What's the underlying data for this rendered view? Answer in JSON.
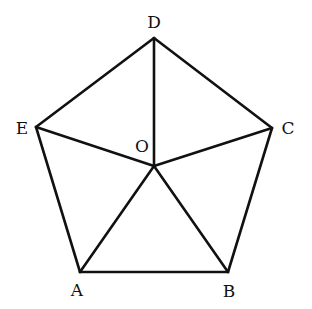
{
  "diagram": {
    "type": "regular-pentagon-with-center",
    "points": {
      "A": {
        "label": "A",
        "x": 80,
        "y": 272,
        "lx": 77,
        "ly": 296
      },
      "B": {
        "label": "B",
        "x": 228,
        "y": 272,
        "lx": 229,
        "ly": 297
      },
      "C": {
        "label": "C",
        "x": 272,
        "y": 128,
        "lx": 288,
        "ly": 134
      },
      "D": {
        "label": "D",
        "x": 154,
        "y": 38,
        "lx": 154,
        "ly": 28
      },
      "E": {
        "label": "E",
        "x": 36,
        "y": 127,
        "lx": 22,
        "ly": 134
      },
      "O": {
        "label": "O",
        "x": 154,
        "y": 166,
        "lx": 142,
        "ly": 152
      }
    },
    "edges": [
      [
        "A",
        "B"
      ],
      [
        "B",
        "C"
      ],
      [
        "C",
        "D"
      ],
      [
        "D",
        "E"
      ],
      [
        "E",
        "A"
      ],
      [
        "O",
        "A"
      ],
      [
        "O",
        "B"
      ],
      [
        "O",
        "C"
      ],
      [
        "O",
        "D"
      ],
      [
        "O",
        "E"
      ]
    ],
    "line_color": "#111111"
  }
}
